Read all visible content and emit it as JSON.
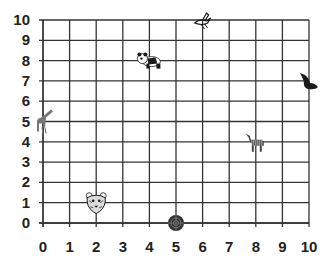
{
  "chart_data": {
    "type": "scatter",
    "title": "",
    "xlabel": "",
    "ylabel": "",
    "xlim": [
      0,
      10
    ],
    "ylim": [
      0,
      10
    ],
    "grid": true,
    "x_ticks": [
      "0",
      "1",
      "2",
      "3",
      "4",
      "5",
      "6",
      "7",
      "8",
      "9",
      "10"
    ],
    "y_ticks": [
      "0",
      "1",
      "2",
      "3",
      "4",
      "5",
      "6",
      "7",
      "8",
      "9",
      "10"
    ],
    "points": [
      {
        "name": "panda",
        "x": 4,
        "y": 8
      },
      {
        "name": "bird",
        "x": 6,
        "y": 10
      },
      {
        "name": "seal",
        "x": 10,
        "y": 7
      },
      {
        "name": "giraffe",
        "x": 0,
        "y": 5
      },
      {
        "name": "zebra",
        "x": 8,
        "y": 4
      },
      {
        "name": "tiger",
        "x": 2,
        "y": 1
      },
      {
        "name": "armadillo",
        "x": 5,
        "y": 0
      }
    ]
  },
  "colors": {
    "grid": "#333333",
    "labels": "#222222",
    "icons": "#1a1a1a"
  }
}
